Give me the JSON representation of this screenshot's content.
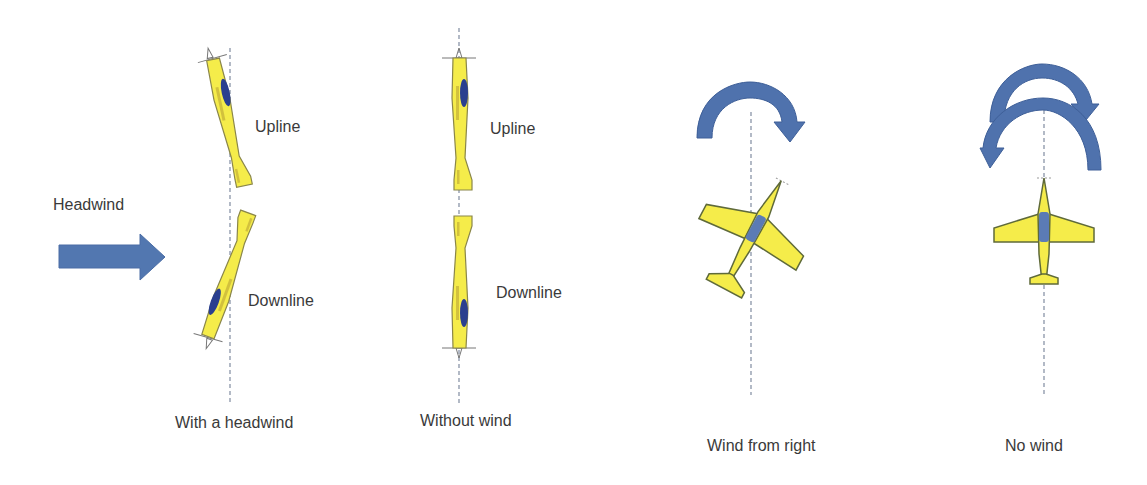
{
  "labels": {
    "headwind": "Headwind",
    "upline_1": "Upline",
    "downline_1": "Downline",
    "with_headwind": "With a headwind",
    "upline_2": "Upline",
    "downline_2": "Downline",
    "without_wind": "Without wind",
    "wind_from_right": "Wind from right",
    "no_wind": "No wind"
  },
  "colors": {
    "plane_fill": "#f5ec4a",
    "plane_stroke": "#7d7a3a",
    "canopy": "#2a3f8f",
    "canopy_top_view": "#5b7bb5",
    "arrow": "#5277b0",
    "arrow_dark": "#3f5f99",
    "reference_line": "#8a95a8"
  },
  "panels": [
    {
      "id": "with-headwind",
      "caption": "With a headwind",
      "items": [
        "Upline",
        "Downline"
      ],
      "arrow": "Headwind"
    },
    {
      "id": "without-wind",
      "caption": "Without wind",
      "items": [
        "Upline",
        "Downline"
      ]
    },
    {
      "id": "wind-from-right",
      "caption": "Wind from right"
    },
    {
      "id": "no-wind",
      "caption": "No wind"
    }
  ]
}
